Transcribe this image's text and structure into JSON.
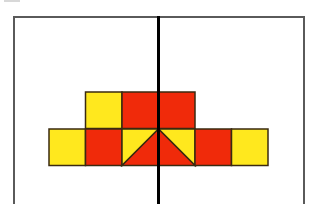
{
  "diagram": {
    "colors": {
      "yellow": "#FFE81E",
      "red": "#F02A0A",
      "outline": "#3a2a10",
      "frame": "#5a5a5a",
      "mirror_line": "#000000"
    },
    "grid": {
      "cell_size": 36.5,
      "origin_x": 49,
      "rows": [
        {
          "y": 92,
          "cells": [
            {
              "col": 1,
              "fill": "yellow"
            },
            {
              "col": 2,
              "fill": "red"
            },
            {
              "col": 3,
              "fill": "red"
            }
          ]
        },
        {
          "y": 129,
          "cells": [
            {
              "col": 0,
              "fill": "yellow"
            },
            {
              "col": 1,
              "fill": "red"
            },
            {
              "col": 2,
              "fill": "split",
              "diagonal": "bottom-left-to-top-right",
              "upper": "yellow",
              "lower": "red"
            },
            {
              "col": 3,
              "fill": "split",
              "diagonal": "top-left-to-bottom-right",
              "upper": "yellow",
              "lower": "red"
            },
            {
              "col": 4,
              "fill": "red"
            },
            {
              "col": 5,
              "fill": "yellow"
            }
          ]
        }
      ]
    },
    "mirror_line": {
      "orientation": "vertical",
      "x": 158
    }
  }
}
